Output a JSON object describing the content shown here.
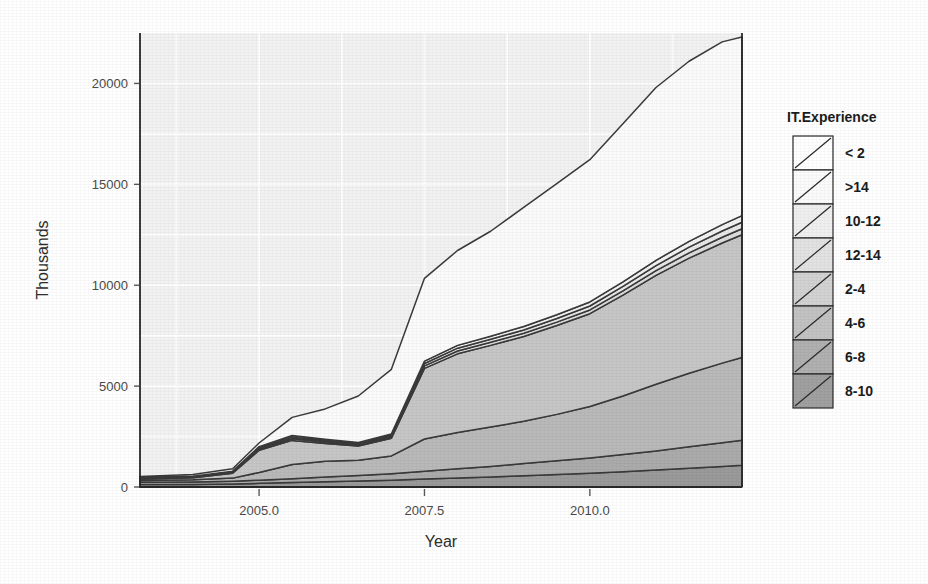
{
  "chart_data": {
    "type": "area",
    "title": "",
    "xlabel": "Year",
    "ylabel": "Thousands",
    "legend_title": "IT.Experience",
    "legend_position": "right",
    "grid": true,
    "stacked": true,
    "xlim": [
      2003.2,
      2012.3
    ],
    "ylim": [
      0,
      22500
    ],
    "xticks": [
      2005.0,
      2007.5,
      2010.0
    ],
    "xtick_labels": [
      "2005.0",
      "2007.5",
      "2010.0"
    ],
    "yticks": [
      0,
      5000,
      10000,
      15000,
      20000
    ],
    "ytick_labels": [
      "0",
      "5000",
      "10000",
      "15000",
      "20000"
    ],
    "x": [
      2003.2,
      2004.0,
      2004.6,
      2005.0,
      2005.5,
      2006.0,
      2006.5,
      2007.0,
      2007.5,
      2008.0,
      2008.5,
      2009.0,
      2009.5,
      2010.0,
      2010.5,
      2011.0,
      2011.5,
      2012.0,
      2012.3
    ],
    "series": [
      {
        "name": "8-10",
        "fill": "#9a9a9a",
        "values": [
          120,
          130,
          150,
          180,
          220,
          260,
          300,
          340,
          400,
          450,
          500,
          560,
          620,
          680,
          760,
          840,
          930,
          1020,
          1080
        ]
      },
      {
        "name": "6-8",
        "fill": "#ababab",
        "values": [
          110,
          120,
          140,
          160,
          190,
          230,
          270,
          320,
          380,
          450,
          520,
          600,
          680,
          760,
          850,
          950,
          1060,
          1170,
          1240
        ]
      },
      {
        "name": "4-6",
        "fill": "#b9b9b9",
        "values": [
          90,
          110,
          150,
          380,
          700,
          790,
          760,
          880,
          1600,
          1800,
          1950,
          2100,
          2300,
          2550,
          2900,
          3300,
          3650,
          3950,
          4100
        ]
      },
      {
        "name": "2-4",
        "fill": "#c6c6c6",
        "values": [
          80,
          100,
          240,
          1100,
          1200,
          880,
          700,
          880,
          3500,
          3900,
          4050,
          4200,
          4400,
          4600,
          5000,
          5400,
          5700,
          5950,
          6080
        ]
      },
      {
        "name": "12-14",
        "fill": "#dcdcdc",
        "values": [
          20,
          25,
          35,
          60,
          80,
          70,
          60,
          70,
          120,
          140,
          150,
          160,
          170,
          185,
          210,
          235,
          265,
          290,
          300
        ]
      },
      {
        "name": "10-12",
        "fill": "#e8e8e8",
        "values": [
          20,
          25,
          35,
          60,
          80,
          70,
          60,
          70,
          120,
          140,
          150,
          165,
          180,
          195,
          220,
          250,
          280,
          305,
          320
        ]
      },
      {
        "name": ">14",
        "fill": "#f2f2f2",
        "values": [
          20,
          25,
          35,
          60,
          80,
          70,
          60,
          70,
          120,
          140,
          155,
          170,
          185,
          200,
          230,
          260,
          290,
          315,
          330
        ]
      },
      {
        "name": "< 2",
        "fill": "#fbfbfb",
        "values": [
          60,
          80,
          120,
          180,
          900,
          1500,
          2300,
          3200,
          4100,
          4700,
          5200,
          5900,
          6500,
          7050,
          7830,
          8565,
          8925,
          9060,
          8850
        ]
      }
    ],
    "legend_entries": [
      {
        "label": "< 2",
        "fill": "#ffffff"
      },
      {
        "label": ">14",
        "fill": "#fbfbfb"
      },
      {
        "label": "10-12",
        "fill": "#efefef"
      },
      {
        "label": "12-14",
        "fill": "#e2e2e2"
      },
      {
        "label": "2-4",
        "fill": "#d2d2d2"
      },
      {
        "label": "4-6",
        "fill": "#c2c2c2"
      },
      {
        "label": "6-8",
        "fill": "#b0b0b0"
      },
      {
        "label": "8-10",
        "fill": "#a0a0a0"
      }
    ],
    "colors": {
      "panel_background": "#f2f2f2",
      "gridline": "#ffffff",
      "axis_text": "#4a4a4a",
      "axis_title": "#2e2e2e",
      "series_outline": "#3a3a3a"
    }
  }
}
